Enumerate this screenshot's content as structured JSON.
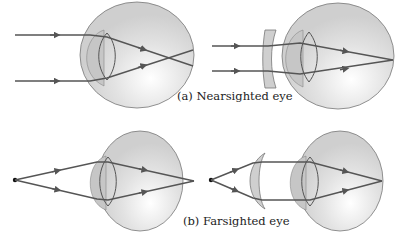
{
  "figure": {
    "panels": [
      {
        "id": "a",
        "caption": "(a) Nearsighted eye",
        "left_view": "uncorrected nearsighted eye: parallel rays focus in front of retina",
        "right_view": "corrected with diverging (concave) lens: rays focus on retina"
      },
      {
        "id": "b",
        "caption": "(b) Farsighted eye",
        "left_view": "uncorrected farsighted eye: rays from near point focus behind retina",
        "right_view": "corrected with converging (convex) lens: rays focus on retina"
      }
    ],
    "colors": {
      "eye_fill": "#d6d6d6",
      "cornea_fill": "#c4c4c4",
      "ray": "#555555",
      "lens_fill": "#cfcfcf"
    },
    "icons": {
      "point_source": "black-dot",
      "ray_direction": "arrowhead"
    }
  }
}
